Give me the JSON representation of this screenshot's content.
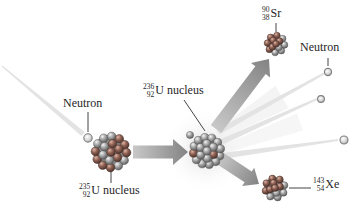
{
  "figure": {
    "type": "nuclear-fission-diagram",
    "labels": {
      "neutron_left": "Neutron",
      "neutron_right": "Neutron",
      "u235": {
        "mass": "235",
        "atomic": "92",
        "name": "U nucleus"
      },
      "u236": {
        "mass": "236",
        "atomic": "92",
        "name": "U nucleus"
      },
      "sr90": {
        "mass": "90",
        "atomic": "38",
        "name": "Sr"
      },
      "xe143": {
        "mass": "143",
        "atomic": "54",
        "name": "Xe"
      }
    },
    "colors": {
      "background": "#ffffff",
      "text": "#262626",
      "arrow_light": "#c8c8c8",
      "arrow_dark": "#838383",
      "trail": "#e3e3e3",
      "nucleon_gray": "#a6a6a6",
      "nucleon_brown": "#8f6154",
      "neutron_sphere": "#d6d6d6",
      "pointer_line": "#444444"
    }
  }
}
